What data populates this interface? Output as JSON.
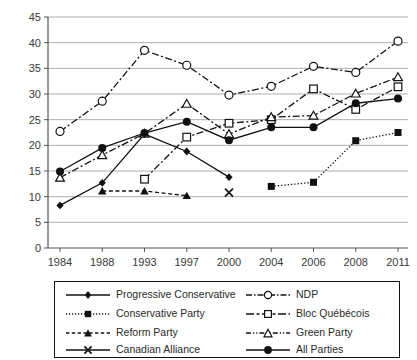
{
  "chart_data": {
    "type": "line",
    "title": "",
    "xlabel": "",
    "ylabel": "",
    "categories": [
      "1984",
      "1988",
      "1993",
      "1997",
      "2000",
      "2004",
      "2006",
      "2008",
      "2011"
    ],
    "ylim": [
      0,
      45
    ],
    "ytick_step": 5,
    "yticks": [
      "0",
      "5",
      "10",
      "15",
      "20",
      "25",
      "30",
      "35",
      "40",
      "45"
    ],
    "grid": "horizontal",
    "legend_position": "bottom",
    "legend_columns": 2,
    "series": [
      {
        "name": "Progressive Conservative",
        "marker": "filled-diamond",
        "line": "solid",
        "x": [
          "1984",
          "1988",
          "1993",
          "1997",
          "2000"
        ],
        "values": [
          8.3,
          12.7,
          22.2,
          18.8,
          13.8
        ]
      },
      {
        "name": "Conservative Party",
        "marker": "filled-square",
        "line": "dotted",
        "x": [
          "2004",
          "2006",
          "2008",
          "2011"
        ],
        "values": [
          12.0,
          12.8,
          20.9,
          22.5
        ]
      },
      {
        "name": "Reform Party",
        "marker": "filled-triangle",
        "line": "dashed",
        "x": [
          "1988",
          "1993",
          "1997"
        ],
        "values": [
          11.1,
          11.1,
          10.2
        ]
      },
      {
        "name": "Canadian Alliance",
        "marker": "cross-x",
        "line": "solid",
        "x": [
          "2000"
        ],
        "values": [
          10.8
        ]
      },
      {
        "name": "NDP",
        "marker": "open-circle",
        "line": "dash-dot",
        "x": [
          "1984",
          "1988",
          "1993",
          "1997",
          "2000",
          "2004",
          "2006",
          "2008",
          "2011"
        ],
        "values": [
          22.7,
          28.6,
          38.5,
          35.6,
          29.8,
          31.5,
          35.4,
          34.2,
          40.3
        ]
      },
      {
        "name": "Bloc Québécois",
        "marker": "open-square",
        "line": "dash-dot",
        "x": [
          "1993",
          "1997",
          "2000",
          "2004",
          "2006",
          "2008",
          "2011"
        ],
        "values": [
          13.4,
          21.6,
          24.3,
          25.0,
          31.0,
          27.0,
          31.4
        ]
      },
      {
        "name": "Green Party",
        "marker": "open-triangle",
        "line": "dash-dot",
        "x": [
          "1984",
          "1988",
          "1993",
          "1997",
          "2000",
          "2004",
          "2006",
          "2008",
          "2011"
        ],
        "values": [
          13.7,
          18.1,
          22.3,
          28.1,
          22.2,
          25.5,
          25.8,
          30.1,
          33.3
        ]
      },
      {
        "name": "All Parties",
        "marker": "filled-circle",
        "line": "solid",
        "x": [
          "1984",
          "1988",
          "1993",
          "1997",
          "2000",
          "2004",
          "2006",
          "2008",
          "2011"
        ],
        "values": [
          14.9,
          19.5,
          22.4,
          24.6,
          21.0,
          23.5,
          23.5,
          28.2,
          29.1
        ]
      }
    ]
  },
  "legend": {
    "items": [
      {
        "label": "Progressive Conservative",
        "key": "pc-key"
      },
      {
        "label": "NDP",
        "key": "ndp-key"
      },
      {
        "label": "Conservative Party",
        "key": "cp-key"
      },
      {
        "label": "Bloc Québécois",
        "key": "bq-key"
      },
      {
        "label": "Reform Party",
        "key": "rp-key"
      },
      {
        "label": "Green Party",
        "key": "gp-key"
      },
      {
        "label": "Canadian Alliance",
        "key": "ca-key"
      },
      {
        "label": "All Parties",
        "key": "ap-key"
      }
    ]
  },
  "colors": {
    "line": "#111111",
    "grid": "#9a9a9a",
    "axis": "#555555",
    "text": "#2a2a2a",
    "background": "#ffffff"
  }
}
